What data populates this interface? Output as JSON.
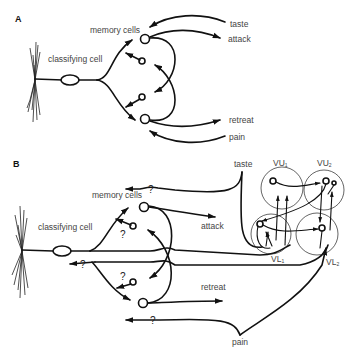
{
  "panels": [
    {
      "id": "A",
      "label": "A",
      "labels": {
        "classifying_cell": "classifying cell",
        "memory_cells": "memory cells",
        "taste": "taste",
        "attack": "attack",
        "retreat": "retreat",
        "pain": "pain"
      }
    },
    {
      "id": "B",
      "label": "B",
      "labels": {
        "classifying_cell": "classifying cell",
        "memory_cells": "memory cells",
        "taste": "taste",
        "attack": "attack",
        "retreat": "retreat",
        "pain": "pain",
        "unknown_marker": "?"
      },
      "ganglia": [
        {
          "name": "VU",
          "sub": "1"
        },
        {
          "name": "VU",
          "sub": "2"
        },
        {
          "name": "VL",
          "sub": "1"
        },
        {
          "name": "VL",
          "sub": "2"
        }
      ]
    }
  ]
}
